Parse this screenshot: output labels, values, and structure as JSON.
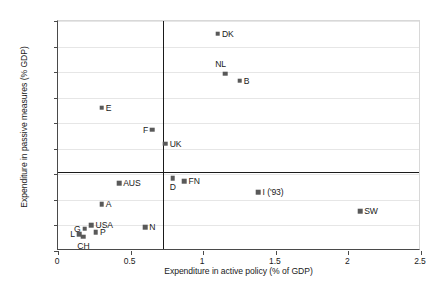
{
  "chart_data": {
    "type": "scatter",
    "title": "",
    "xlabel": "Expenditure in active policy (% of GDP)",
    "ylabel": "Expenditure in passive measures (% GDP)",
    "xlim": [
      0,
      2.5
    ],
    "ylim": [
      0,
      4.5
    ],
    "xticks": [
      "0",
      "0.5",
      "1",
      "1.5",
      "2",
      "2.5"
    ],
    "xtick_values": [
      0,
      0.5,
      1,
      1.5,
      2,
      2.5
    ],
    "yticks": [
      "0",
      "0.5",
      "1",
      "1.5",
      "2",
      "2.5",
      "3",
      "3.5",
      "4",
      "4.5"
    ],
    "ytick_values": [
      0,
      0.5,
      1,
      1.5,
      2,
      2.5,
      3,
      3.5,
      4,
      4.5
    ],
    "grid": true,
    "legend": "none",
    "marker_color": "#595959",
    "reference_lines": {
      "vertical_x": 0.72,
      "horizontal_y": 1.55,
      "color": "#1a1a1a"
    },
    "points": [
      {
        "label": "DK",
        "x": 1.1,
        "y": 4.25,
        "label_pos": "right"
      },
      {
        "label": "NL",
        "x": 1.15,
        "y": 3.47,
        "label_pos": "aboveleft"
      },
      {
        "label": "B",
        "x": 1.25,
        "y": 3.33,
        "label_pos": "right"
      },
      {
        "label": "E",
        "x": 0.3,
        "y": 2.8,
        "label_pos": "right"
      },
      {
        "label": "F",
        "x": 0.65,
        "y": 2.37,
        "label_pos": "left"
      },
      {
        "label": "UK",
        "x": 0.74,
        "y": 2.1,
        "label_pos": "right"
      },
      {
        "label": "D",
        "x": 0.79,
        "y": 1.43,
        "label_pos": "below"
      },
      {
        "label": "FN",
        "x": 0.87,
        "y": 1.37,
        "label_pos": "right"
      },
      {
        "label": "AUS",
        "x": 0.42,
        "y": 1.33,
        "label_pos": "right"
      },
      {
        "label": "I ('93)",
        "x": 1.38,
        "y": 1.15,
        "label_pos": "right"
      },
      {
        "label": "A",
        "x": 0.3,
        "y": 0.92,
        "label_pos": "right"
      },
      {
        "label": "SW",
        "x": 2.08,
        "y": 0.78,
        "label_pos": "right"
      },
      {
        "label": "USA",
        "x": 0.23,
        "y": 0.5,
        "label_pos": "right"
      },
      {
        "label": "N",
        "x": 0.6,
        "y": 0.47,
        "label_pos": "right"
      },
      {
        "label": "G",
        "x": 0.185,
        "y": 0.44,
        "label_pos": "left"
      },
      {
        "label": "P",
        "x": 0.26,
        "y": 0.37,
        "label_pos": "right"
      },
      {
        "label": "L",
        "x": 0.145,
        "y": 0.33,
        "label_pos": "left"
      },
      {
        "label": "CH",
        "x": 0.175,
        "y": 0.28,
        "label_pos": "below"
      }
    ]
  }
}
